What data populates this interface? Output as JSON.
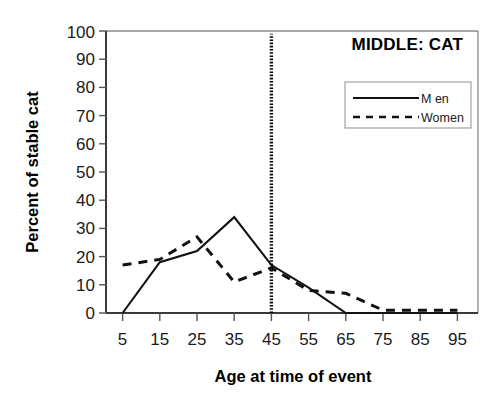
{
  "chart_data": {
    "type": "line",
    "title": "MIDDLE: CAT",
    "xlabel": "Age at time of event",
    "ylabel": "Percent of stable cat",
    "categories": [
      5,
      15,
      25,
      35,
      45,
      55,
      65,
      75,
      85,
      95
    ],
    "xtick_labels": [
      "5",
      "15",
      "25",
      "35",
      "45",
      "55",
      "65",
      "75",
      "85",
      "95"
    ],
    "ytick_labels": [
      "0",
      "10",
      "20",
      "30",
      "40",
      "50",
      "60",
      "70",
      "80",
      "90",
      "100"
    ],
    "ylim": [
      0,
      100
    ],
    "xlim": [
      0,
      100
    ],
    "ytick_step": 10,
    "grid": false,
    "legend_position": "top-right",
    "series": [
      {
        "name": "M en",
        "style": "solid",
        "values": [
          0,
          18,
          22,
          34,
          17,
          9,
          0,
          0,
          0,
          0
        ]
      },
      {
        "name": "Women",
        "style": "dashed",
        "values": [
          17,
          19,
          27,
          11,
          16,
          8,
          7,
          1,
          1,
          1
        ]
      }
    ],
    "annotations": [
      {
        "name": "vertical-reference-line",
        "type": "vline",
        "x": 45,
        "y_from": 0,
        "y_to": 99,
        "style": "dotted"
      }
    ]
  },
  "legend": {
    "entries": [
      {
        "label": "M en",
        "style": "solid"
      },
      {
        "label": "Women",
        "style": "dashed"
      }
    ]
  }
}
